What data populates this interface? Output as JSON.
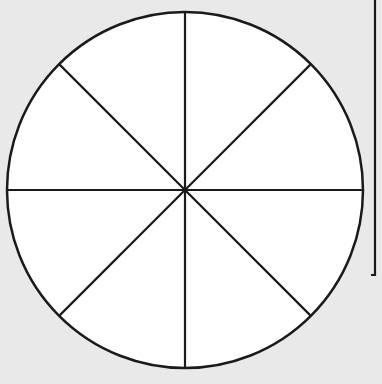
{
  "diagram": {
    "type": "fraction-circle",
    "slices": 8,
    "shaded_slices": 0,
    "fill_color": "#ffffff",
    "stroke_color": "#1a1a1a",
    "background_color": "#e9e9e9",
    "circle": {
      "cx": 185,
      "cy": 190,
      "r": 178
    }
  }
}
